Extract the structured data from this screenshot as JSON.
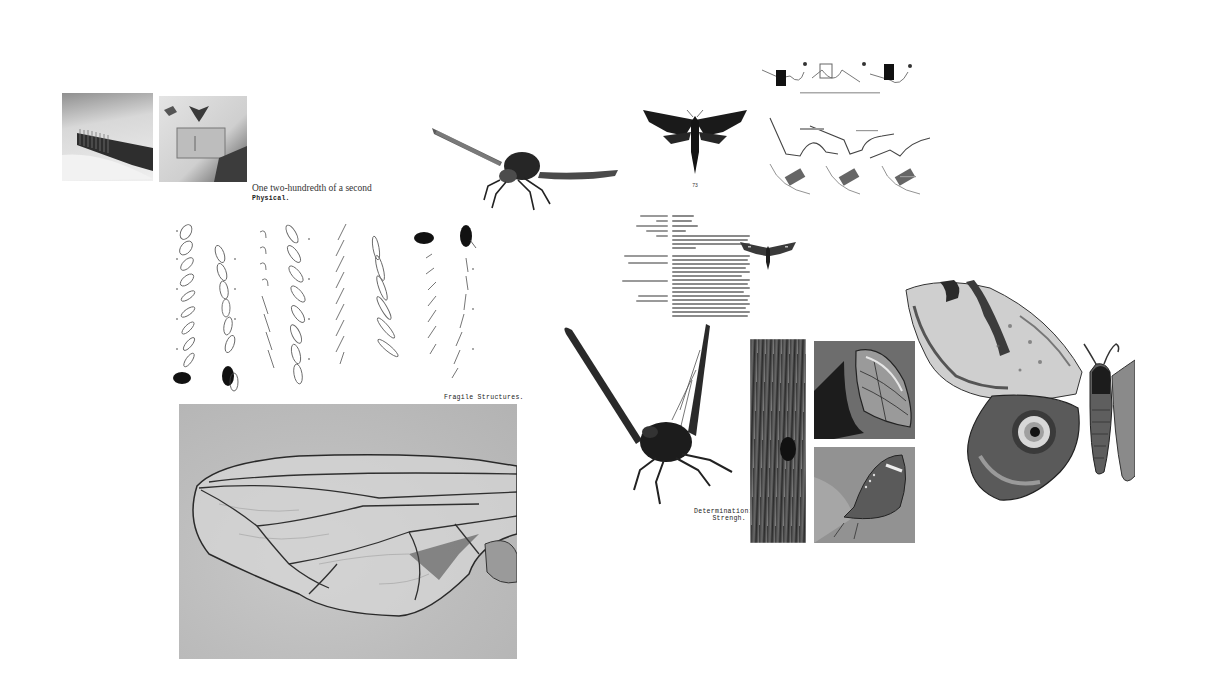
{
  "board": {
    "background": "#ffffff",
    "captions": {
      "fly_photo_caption": "One two-hundredth of a second",
      "physical_label": "Physical.",
      "fragile_label": "Fragile Structures.",
      "determination_line1": "Determination:",
      "determination_line2": "Strengh.",
      "moth_plate_number": "73"
    },
    "images": [
      {
        "id": "photo-spine-row",
        "icon": "photo-icon",
        "desc": "close-up photo of pinned insect row"
      },
      {
        "id": "photo-specimen-case",
        "icon": "photo-icon",
        "desc": "photo of specimen card with pinned moths"
      },
      {
        "id": "fly-in-flight",
        "icon": "insect-icon",
        "desc": "fly in flight, wings spread"
      },
      {
        "id": "hawk-moth-plate",
        "icon": "moth-icon",
        "desc": "dark hawk moth illustration"
      },
      {
        "id": "wing-mechanism-diagram",
        "icon": "diagram-icon",
        "desc": "diagrams of insect flight muscle mechanism"
      },
      {
        "id": "flight-sequence",
        "icon": "sequence-icon",
        "desc": "stroboscopic wing-beat sequences of flies"
      },
      {
        "id": "moth-fact-sheet",
        "icon": "document-icon",
        "desc": "moth species fact sheet with small moth"
      },
      {
        "id": "fly-wing-macro",
        "icon": "wing-icon",
        "desc": "macro photo of a fly wing"
      },
      {
        "id": "insect-wings-raised",
        "icon": "insect-icon",
        "desc": "insect with raised wings"
      },
      {
        "id": "camouflage-triptych",
        "icon": "photo-icon",
        "desc": "bark texture and camouflaged butterflies"
      },
      {
        "id": "emperor-moth",
        "icon": "moth-icon",
        "desc": "large eyespot moth"
      }
    ]
  }
}
